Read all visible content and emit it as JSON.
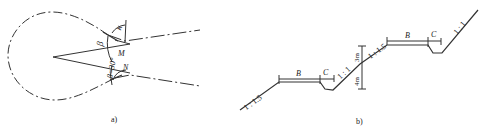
{
  "figure": {
    "panel_a": {
      "caption": "a)",
      "labels": {
        "kappa": "κ",
        "beta": "β",
        "beta_eq": "β=30°",
        "M": "M",
        "N": "N"
      }
    },
    "panel_b": {
      "caption": "b)",
      "labels": {
        "slope_low": "1 : 1.5",
        "bench_low": "B",
        "ditch_low": "C",
        "slope_mid_lower": "1 : 1",
        "height_upper": "3m",
        "height_lower": "4m",
        "slope_mid_upper": "1 : 1.5",
        "bench_high": "B",
        "ditch_high": "C",
        "slope_top": "1 : 1"
      }
    }
  },
  "colors": {
    "line": "#333333",
    "background": "#ffffff"
  }
}
